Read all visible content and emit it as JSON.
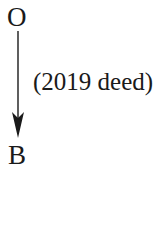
{
  "diagram": {
    "nodes": [
      {
        "id": "O",
        "label": "O"
      },
      {
        "id": "B",
        "label": "B"
      }
    ],
    "edges": [
      {
        "from": "O",
        "to": "B",
        "label": "(2019 deed)",
        "direction": "down"
      }
    ],
    "colors": {
      "ink": "#1a1a1a",
      "background": "#ffffff"
    }
  }
}
